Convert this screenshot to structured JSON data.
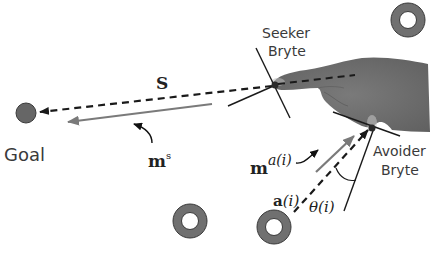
{
  "diagram": {
    "labels": {
      "goal": "Goal",
      "seeker_line1": "Seeker",
      "seeker_line2": "Bryte",
      "avoider_line1": "Avoider",
      "avoider_line2": "Bryte",
      "s_vector": "S",
      "ms_base": "m",
      "ms_sup": "s",
      "ma_base": "m",
      "ma_sup": "a(i)",
      "a_base": "a",
      "a_arg": "(i)",
      "theta": "θ(i)"
    },
    "colors": {
      "goal_fill": "#666666",
      "obstacle_fill": "#707070",
      "hand_fill": "#6e6e6e",
      "arrow_gray": "#7a7a7a",
      "line_dark": "#1a1a1a"
    },
    "elements": {
      "goal": "goal-circle",
      "obstacles": [
        "obstacle-top-right",
        "obstacle-bottom-left",
        "obstacle-bottom-center"
      ],
      "vectors": [
        "s-dashed-vector",
        "ms-motion-vector",
        "a-dashed-vector",
        "ma-motion-vector"
      ]
    }
  }
}
